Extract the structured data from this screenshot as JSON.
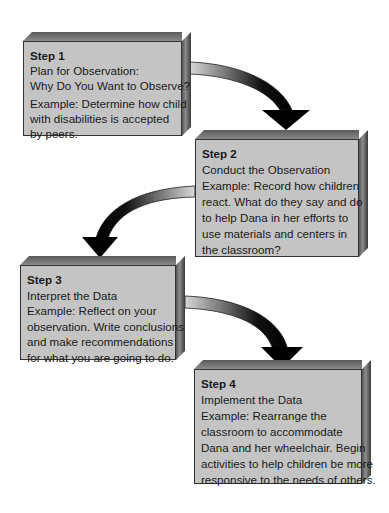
{
  "steps": [
    {
      "title": "Step 1",
      "heading_lines": [
        "Plan for Observation:",
        "Why Do You Want to Observe?"
      ],
      "example_lines": [
        "Example: Determine how child",
        "with disabilities is accepted",
        "by peers."
      ]
    },
    {
      "title": "Step 2",
      "heading_lines": [
        "Conduct the Observation"
      ],
      "example_lines": [
        "Example: Record how children",
        "react. What do they say and do",
        "to help Dana in her efforts to",
        "use materials and centers in",
        "the classroom?"
      ]
    },
    {
      "title": "Step 3",
      "heading_lines": [
        "Interpret the Data"
      ],
      "example_lines": [
        "Example: Reflect on your",
        "observation. Write conclusions",
        "and make recommendations",
        "for what you are going to do."
      ]
    },
    {
      "title": "Step 4",
      "heading_lines": [
        "Implement the Data"
      ],
      "example_lines": [
        "Example: Rearrange the",
        "classroom to accommodate",
        "Dana and her wheelchair. Begin",
        "activities to help children be more",
        "responsive to the needs of others."
      ]
    }
  ],
  "colors": {
    "box_face": "#c4c4c4",
    "arrow": "#111111",
    "text": "#1a1a1a"
  }
}
